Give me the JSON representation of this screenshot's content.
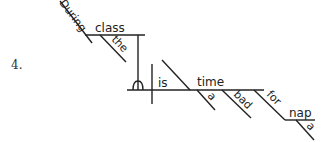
{
  "item_number": "4.",
  "sentence": "During class the baby is a bad time for a nap",
  "words": {
    "during": "During",
    "class": "class",
    "the": "the",
    "is": "is",
    "time": "time",
    "a1": "a",
    "bad": "bad",
    "for": "for",
    "nap": "nap",
    "a2": "a"
  },
  "colors": {
    "ink": "#222222",
    "background": "#ffffff"
  }
}
